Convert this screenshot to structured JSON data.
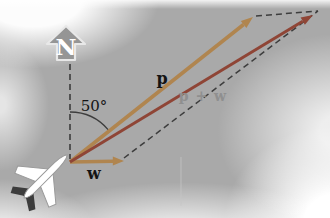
{
  "diagram": {
    "north_label": "N",
    "angle_label": "50°",
    "vector_p_label": "p",
    "vector_w_label": "w",
    "resultant_label": "p + w",
    "colors": {
      "sky_base": "#a9a9a9",
      "vector_tan": "#b0854f",
      "resultant_red": "#8f4536",
      "dashed_line": "#3d3d3d",
      "north_arrow_fill": "#959595",
      "north_arrow_edge": "#e8e8e8",
      "north_letter": "#ffffff",
      "label_dark": "#141414",
      "label_muted": "#8f8f8f",
      "plane_body": "#ffffff",
      "plane_outline": "#9a9a9a",
      "plane_tail_dark": "#3c3c3c",
      "crease_line": "#c6c6c6"
    }
  }
}
